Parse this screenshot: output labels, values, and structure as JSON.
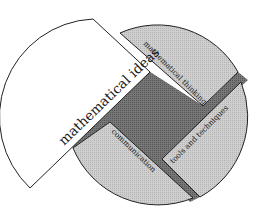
{
  "diagram": {
    "type": "circular-segmented-diagram",
    "segments": [
      {
        "id": "mathematical-ideas",
        "label": "mathematical ideas",
        "fill": "#ffffff",
        "position": "left, pulled out"
      },
      {
        "id": "mathematical-thinking",
        "label": "mathematical thinking",
        "fill": "#c8c8c8",
        "position": "top-right"
      },
      {
        "id": "tools-and-techniques",
        "label": "tools and techniques",
        "fill": "#c8c8c8",
        "position": "bottom-right"
      },
      {
        "id": "communication",
        "label": "communication",
        "fill": "#c8c8c8",
        "position": "bottom"
      }
    ],
    "center": {
      "id": "core",
      "fill": "#6e6e6e"
    },
    "colors": {
      "outline": "#222222",
      "light_segment": "#c8c8c8",
      "dark_core": "#6e6e6e",
      "gap": "#8c8c8c"
    }
  }
}
